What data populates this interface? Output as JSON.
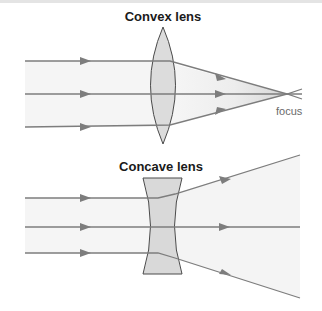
{
  "diagram": {
    "convex": {
      "title": "Convex lens",
      "focus_label": "focus",
      "ray_count": 3,
      "behavior": "converging"
    },
    "concave": {
      "title": "Concave lens",
      "ray_count": 3,
      "behavior": "diverging"
    },
    "colors": {
      "ray": "#7a7a7a",
      "lens_fill": "#d9d9d9",
      "lens_stroke": "#4a4a4a",
      "beam_fill": "#f3f3f3",
      "title_text": "#1a1a1a",
      "label_text": "#6a6a6a"
    }
  }
}
